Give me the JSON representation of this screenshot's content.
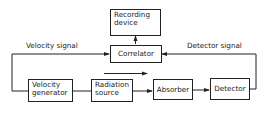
{
  "diagram": {
    "type": "block-diagram",
    "boxes": {
      "recording_device": {
        "line1": "Recording",
        "line2": "device"
      },
      "correlator": {
        "label": "Correlator"
      },
      "velocity_generator": {
        "line1": "Velocity",
        "line2": "generator"
      },
      "radiation_source": {
        "line1": "Radiation",
        "line2": "source"
      },
      "absorber": {
        "label": "Absorber"
      },
      "detector": {
        "label": "Detector"
      }
    },
    "signals": {
      "velocity_signal": "Velocity signal",
      "detector_signal": "Detector signal"
    },
    "colors": {
      "stroke": "#222222",
      "background": "#ffffff"
    }
  }
}
